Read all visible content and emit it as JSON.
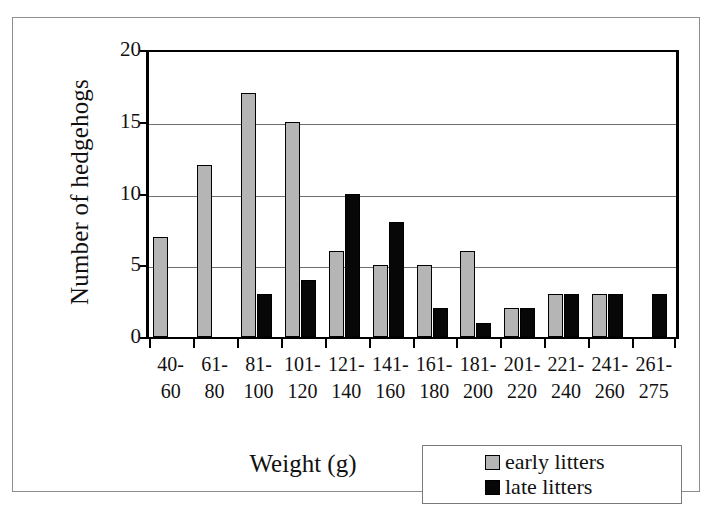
{
  "chart_data": {
    "type": "bar",
    "title": "",
    "xlabel": "Weight (g)",
    "ylabel": "Number of hedgehogs",
    "ylim": [
      0,
      20
    ],
    "yticks": [
      0,
      5,
      10,
      15,
      20
    ],
    "grid": true,
    "legend_position": "bottom-right",
    "categories": [
      "40-60",
      "61-80",
      "81-100",
      "101-120",
      "121-140",
      "141-160",
      "161-180",
      "181-200",
      "201-220",
      "221-240",
      "241-260",
      "261-275"
    ],
    "category_lines": [
      [
        "40-",
        "60"
      ],
      [
        "61-",
        "80"
      ],
      [
        "81-",
        "100"
      ],
      [
        "101-",
        "120"
      ],
      [
        "121-",
        "140"
      ],
      [
        "141-",
        "160"
      ],
      [
        "161-",
        "180"
      ],
      [
        "181-",
        "200"
      ],
      [
        "201-",
        "220"
      ],
      [
        "221-",
        "240"
      ],
      [
        "241-",
        "260"
      ],
      [
        "261-",
        "275"
      ]
    ],
    "series": [
      {
        "name": "early litters",
        "color": "#b5b5b5",
        "values": [
          7,
          12,
          17,
          15,
          6,
          5,
          5,
          6,
          2,
          3,
          3,
          0
        ]
      },
      {
        "name": "late litters",
        "color": "#070707",
        "values": [
          0,
          0,
          3,
          4,
          10,
          8,
          2,
          1,
          2,
          3,
          3,
          3
        ]
      }
    ]
  },
  "legend": {
    "items": [
      {
        "label": "early litters",
        "swatch": "early"
      },
      {
        "label": "late litters",
        "swatch": "late"
      }
    ]
  }
}
